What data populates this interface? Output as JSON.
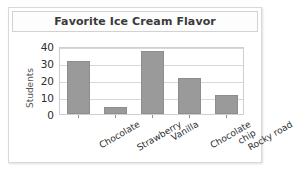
{
  "card": {
    "background_color": "#ffffff",
    "border_color": "#d9d9d9"
  },
  "title": {
    "text": "Favorite Ice Cream Flavor"
  },
  "axes": {
    "y_title": "Students",
    "y_ticks": [
      "40",
      "30",
      "20",
      "10",
      "0"
    ],
    "x_labels": [
      {
        "line1": "Chocolate",
        "line2": ""
      },
      {
        "line1": "Strawberry",
        "line2": ""
      },
      {
        "line1": "Vanilla",
        "line2": ""
      },
      {
        "line1": "Chocolate",
        "line2": "chip"
      },
      {
        "line1": "Rocky road",
        "line2": ""
      }
    ]
  },
  "style": {
    "bar_color": "#9a9a9a",
    "bar_border_color": "#8d8d8d",
    "grid_color": "#d8d8d8",
    "plot_border_color": "#cfcfcf",
    "text_color": "#2c2c2c"
  },
  "chart_data": {
    "type": "bar",
    "title": "Favorite Ice Cream Flavor",
    "xlabel": "",
    "ylabel": "Students",
    "categories": [
      "Chocolate",
      "Strawberry",
      "Vanilla",
      "Chocolate chip",
      "Rocky road"
    ],
    "values": [
      31,
      4,
      37,
      21,
      11
    ],
    "ylim": [
      0,
      40
    ],
    "yticks": [
      0,
      10,
      20,
      30,
      40
    ],
    "grid": true,
    "legend": false,
    "orientation": "vertical"
  }
}
